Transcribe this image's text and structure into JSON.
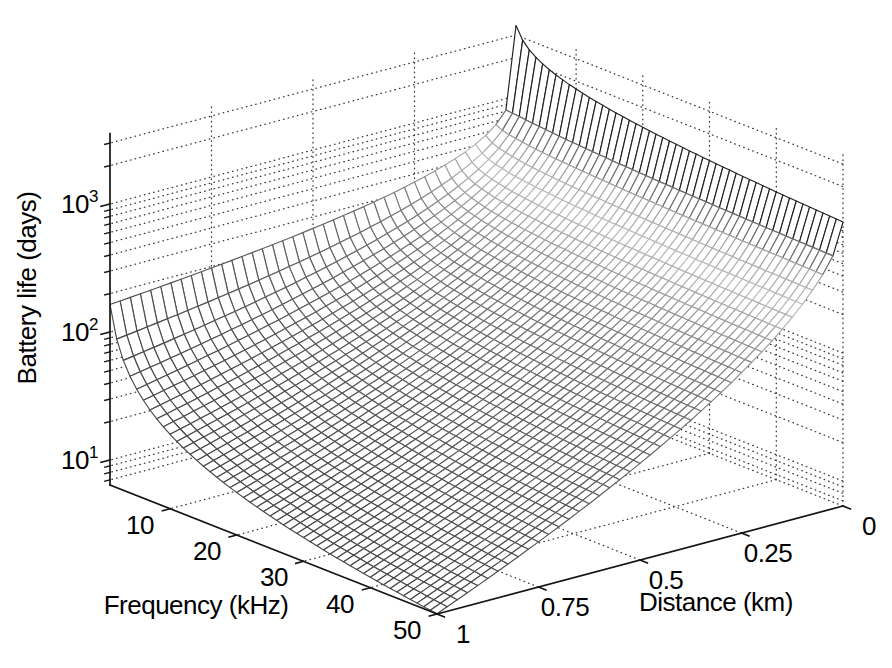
{
  "figure": {
    "background": "#ffffff"
  },
  "style": {
    "axis_color": "#141414",
    "grid_dot_color": "#3c3c3c",
    "label_color": "#000000",
    "mesh_face": "#ffffff",
    "row_shade_stops": [
      [
        0,
        0.13
      ],
      [
        0.03,
        0.13
      ],
      [
        0.042,
        0.62
      ],
      [
        0.11,
        0.74
      ],
      [
        0.19,
        0.62
      ],
      [
        0.28,
        0.5
      ],
      [
        0.45,
        0.41
      ],
      [
        0.7,
        0.34
      ],
      [
        1,
        0.28
      ]
    ]
  },
  "chart_data": {
    "type": "surface",
    "title": "",
    "xlabel": "Frequency (kHz)",
    "ylabel": "Distance (km)",
    "zlabel": "Battery life (days)",
    "x_range_khz": [
      1,
      50
    ],
    "y_range_km": [
      0,
      1
    ],
    "z_scale": "log10",
    "z_range_log10": [
      0.805,
      3.55
    ],
    "x_ticks": [
      10,
      20,
      30,
      40,
      50
    ],
    "y_ticks": [
      "1",
      "0.75",
      "0.5",
      "0.25",
      "0"
    ],
    "y_tick_values": [
      1,
      0.75,
      0.5,
      0.25,
      0
    ],
    "z_ticks": [
      {
        "base": "10",
        "exp": "1",
        "value": 10
      },
      {
        "base": "10",
        "exp": "2",
        "value": 100
      },
      {
        "base": "10",
        "exp": "3",
        "value": 1000
      }
    ],
    "grid": "on",
    "minor_grid": "on",
    "mesh_step": {
      "frequency_khz": 1,
      "distance_km": 0.025
    },
    "surface_model": {
      "formula": "log10(life_days) = base(f) - drop(f) * d^n(f)",
      "base": {
        "c0": 3.55,
        "c1": -0.31
      },
      "drop": {
        "c0": 1.335,
        "c1": 0.519
      },
      "n": {
        "c0": 0.2,
        "c1": 0.235
      },
      "note": "each coefficient = c0 + c1*log10(f_khz); f in kHz, d in km"
    },
    "sample_grid": {
      "frequencies_khz": [
        1,
        10,
        20,
        30,
        40,
        50
      ],
      "distances_km": [
        0,
        0.25,
        0.5,
        0.75,
        1
      ],
      "battery_life_days": [
        [
          3548,
          345,
          244,
          195,
          164
        ],
        [
          1738,
          168,
          74,
          40,
          24
        ],
        [
          1403,
          141,
          54,
          26,
          14
        ],
        [
          1236,
          128,
          45,
          20,
          9.8
        ],
        [
          1130,
          120,
          40,
          16,
          7.7
        ],
        [
          1054,
          115,
          36,
          14,
          6.4
        ]
      ]
    }
  }
}
